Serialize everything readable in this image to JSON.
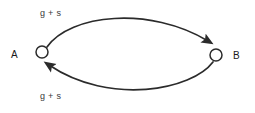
{
  "diagram": {
    "type": "directed-graph",
    "background_color": "#ffffff",
    "stroke_color": "#2b2b2b",
    "nodes": [
      {
        "id": "A",
        "label": "A",
        "cx": 42,
        "cy": 52,
        "r": 6,
        "label_x": 11,
        "label_y": 50
      },
      {
        "id": "B",
        "label": "B",
        "cx": 216,
        "cy": 55,
        "r": 6,
        "label_x": 233,
        "label_y": 51
      }
    ],
    "edges": [
      {
        "id": "edge-top",
        "from": "A",
        "to": "B",
        "label": "g + s",
        "label_x": 40,
        "label_y": 9,
        "direction": "a-to-b",
        "curve": "arc-above"
      },
      {
        "id": "edge-bottom",
        "from": "B",
        "to": "A",
        "label": "g + s",
        "label_x": 40,
        "label_y": 92,
        "direction": "b-to-a",
        "curve": "arc-below"
      }
    ]
  }
}
